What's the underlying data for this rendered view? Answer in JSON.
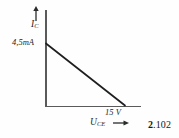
{
  "figure": {
    "number_major": "2",
    "number_minor": ".102",
    "caption_full": "2.102"
  },
  "axes": {
    "y_axis_name": "y-axis",
    "x_axis_name": "x-axis",
    "y_quantity_symbol": "I",
    "y_quantity_subscript": "C",
    "x_quantity_symbol": "U",
    "x_quantity_subscript": "CE",
    "y_intercept_label": "4,5mA",
    "x_intercept_label": "15 V"
  },
  "icons": {
    "y_arrow": "arrow-up-icon",
    "x_arrow": "arrow-right-icon"
  },
  "colors": {
    "background": "#fefefe",
    "axis": "#5a5a5a",
    "line": "#1f1f1f",
    "text": "#262626"
  },
  "chart_data": {
    "type": "line",
    "title": "",
    "subtitle": "",
    "xlabel": "U_CE",
    "ylabel": "I_C",
    "x_unit": "V",
    "y_unit": "mA",
    "xlim": [
      0,
      18
    ],
    "ylim": [
      0,
      5.4
    ],
    "grid": false,
    "legend": null,
    "series": [
      {
        "name": "load line",
        "x": [
          0,
          15
        ],
        "y": [
          4.5,
          0
        ]
      }
    ],
    "annotations": [
      {
        "text": "4,5mA",
        "x": 0,
        "y": 4.5,
        "position": "left"
      },
      {
        "text": "15 V",
        "x": 15,
        "y": 0,
        "position": "below"
      }
    ],
    "xtick_labels": [
      "15 V"
    ],
    "ytick_labels": [
      "4,5mA"
    ]
  }
}
